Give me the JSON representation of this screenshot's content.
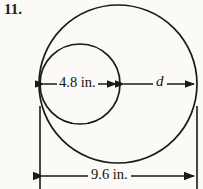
{
  "problem": {
    "number": "11."
  },
  "figure": {
    "type": "two-tangent-circles-diagram",
    "labels": {
      "inner_diameter": "4.8 in.",
      "gap": "d",
      "outer_diameter": "9.6 in."
    },
    "units": "in.",
    "colors": {
      "stroke": "#1a1a1a",
      "background": "#fbfaf7",
      "text": "#111111"
    },
    "geometry": {
      "outer_circle": {
        "cx": 118,
        "cy": 84,
        "r": 79
      },
      "inner_circle": {
        "cx": 80,
        "cy": 84,
        "r": 40
      },
      "inner_dimension_line": {
        "y": 84,
        "x1": 41,
        "x2": 119
      },
      "gap_dimension_line": {
        "y": 84,
        "x1": 121,
        "x2": 197
      },
      "outer_dimension_line": {
        "y": 176,
        "x1": 40,
        "x2": 197
      },
      "extension_line_left": {
        "x": 40,
        "y1": 108,
        "y2": 189
      },
      "extension_line_right": {
        "x": 197,
        "y1": 108,
        "y2": 189
      }
    }
  }
}
